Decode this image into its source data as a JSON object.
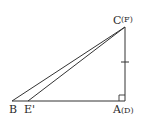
{
  "diagram": {
    "type": "geometry-right-triangle",
    "stroke_color": "#333333",
    "background": "#ffffff",
    "points": {
      "C": {
        "label": "C",
        "alt_label": "(F)",
        "x": 125,
        "y": 27
      },
      "A": {
        "label": "A",
        "alt_label": "(D)",
        "x": 125,
        "y": 101
      },
      "B": {
        "label": "B",
        "x": 12,
        "y": 101
      },
      "E_prime": {
        "label": "E'",
        "x": 28,
        "y": 101
      }
    },
    "segments": [
      {
        "from": "B",
        "to": "A",
        "name": "base"
      },
      {
        "from": "A",
        "to": "C",
        "name": "vertical-side"
      },
      {
        "from": "B",
        "to": "C",
        "name": "hypotenuse-bc"
      },
      {
        "from": "E_prime",
        "to": "C",
        "name": "segment-e-c"
      }
    ],
    "marks": {
      "right_angle_at": "A",
      "tick_on_segment": "AC"
    }
  }
}
